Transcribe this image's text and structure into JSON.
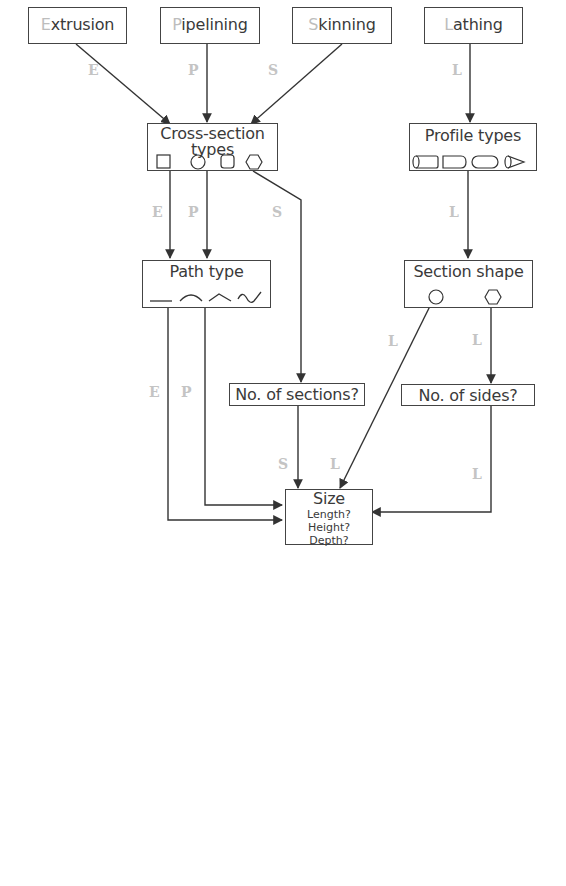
{
  "diagram": {
    "type": "flowchart",
    "colors": {
      "line": "#333333",
      "box_border": "#444444",
      "text": "#3a3a3a",
      "edge_label": "#c4c4c4",
      "initial_letter": "#bdbdbd"
    },
    "methods": [
      {
        "id": "extrusion",
        "initial": "E",
        "rest": "xtrusion"
      },
      {
        "id": "pipelining",
        "initial": "P",
        "rest": "ipelining"
      },
      {
        "id": "skinning",
        "initial": "S",
        "rest": "kinning"
      },
      {
        "id": "lathing",
        "initial": "L",
        "rest": "athing"
      }
    ],
    "nodes": {
      "cross_section": {
        "title": "Cross-section types",
        "icons": [
          "square",
          "circle",
          "rounded-square",
          "hexagon"
        ]
      },
      "profile": {
        "title": "Profile types",
        "icons": [
          "cylinder",
          "rounded-rectangle",
          "capsule",
          "cone"
        ]
      },
      "path": {
        "title": "Path type",
        "icons": [
          "straight-line",
          "arc",
          "angle",
          "s-curve"
        ]
      },
      "section_shape": {
        "title": "Section shape",
        "icons": [
          "circle",
          "hexagon"
        ]
      },
      "num_sections": {
        "title": "No. of sections?"
      },
      "num_sides": {
        "title": "No. of sides?"
      },
      "size": {
        "title": "Size",
        "questions": [
          "Length?",
          "Height?",
          "Depth?"
        ]
      }
    },
    "edges": [
      {
        "from": "extrusion",
        "to": "cross_section",
        "label": "E"
      },
      {
        "from": "pipelining",
        "to": "cross_section",
        "label": "P"
      },
      {
        "from": "skinning",
        "to": "cross_section",
        "label": "S"
      },
      {
        "from": "lathing",
        "to": "profile",
        "label": "L"
      },
      {
        "from": "cross_section",
        "to": "path",
        "label": "E"
      },
      {
        "from": "cross_section",
        "to": "path",
        "label": "P"
      },
      {
        "from": "cross_section",
        "to": "num_sections",
        "label": "S"
      },
      {
        "from": "profile",
        "to": "section_shape",
        "label": "L"
      },
      {
        "from": "path",
        "to": "size",
        "label": "E"
      },
      {
        "from": "path",
        "to": "size",
        "label": "P"
      },
      {
        "from": "num_sections",
        "to": "size",
        "label": "S"
      },
      {
        "from": "section_shape",
        "to": "size",
        "label": "L"
      },
      {
        "from": "section_shape",
        "to": "num_sides",
        "label": "L"
      },
      {
        "from": "num_sides",
        "to": "size",
        "label": "L"
      }
    ]
  }
}
